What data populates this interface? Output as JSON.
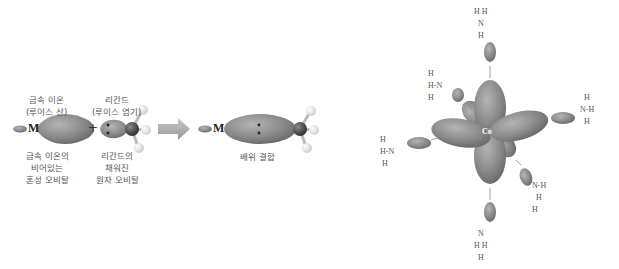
{
  "left_diagram": {
    "metal_symbol": "M",
    "plus": "+",
    "metal_label_top": [
      "금속 이온",
      "(루이스 산)"
    ],
    "ligand_label_top": [
      "리간드",
      "(루이스 염기)"
    ],
    "metal_label_bottom": [
      "금속 이온의",
      "비어있는",
      "혼성 오비탈"
    ],
    "ligand_label_bottom": [
      "리간드의",
      "채워진",
      "원자 오비탈"
    ],
    "result_metal_symbol": "M",
    "result_label": "배위 결합"
  },
  "right_diagram": {
    "center_atom": "Co",
    "ligand_atom": "N",
    "hydrogen": "H",
    "lone_pair_glyph": "‖",
    "ligand_count": 6
  },
  "colors": {
    "orbital_gray": "#8a8a8a",
    "orbital_dark": "#6e6e6e",
    "arrow_gray": "#a8a8a8",
    "text": "#555555"
  }
}
